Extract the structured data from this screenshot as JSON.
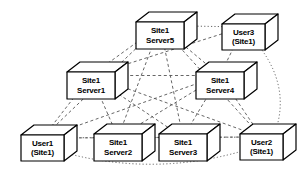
{
  "diagram": {
    "background_color": "#ffffff",
    "line_color": "#555555",
    "node_fill_color": "#ffffff",
    "node_stroke_color": "#000000",
    "node_shape": "3d-box",
    "nodes": [
      {
        "id": "server5",
        "kind": "server",
        "line1": "Site1",
        "line2": "Server5",
        "x": 136,
        "y": 12,
        "w": 48,
        "h": 27,
        "depth_x": 13,
        "depth_y": 10
      },
      {
        "id": "user3",
        "kind": "user",
        "line1": "User3",
        "line2": "(Site1)",
        "x": 222,
        "y": 14,
        "w": 43,
        "h": 26,
        "depth_x": 13,
        "depth_y": 10
      },
      {
        "id": "server1",
        "kind": "server",
        "line1": "Site1",
        "line2": "Server1",
        "x": 67,
        "y": 62,
        "w": 48,
        "h": 27,
        "depth_x": 13,
        "depth_y": 10
      },
      {
        "id": "server4",
        "kind": "server",
        "line1": "Site1",
        "line2": "Server4",
        "x": 196,
        "y": 62,
        "w": 48,
        "h": 27,
        "depth_x": 13,
        "depth_y": 10
      },
      {
        "id": "user1",
        "kind": "user",
        "line1": "User1",
        "line2": "(Site1)",
        "x": 21,
        "y": 125,
        "w": 43,
        "h": 26,
        "depth_x": 13,
        "depth_y": 10
      },
      {
        "id": "server2",
        "kind": "server",
        "line1": "Site1",
        "line2": "Server2",
        "x": 94,
        "y": 124,
        "w": 48,
        "h": 27,
        "depth_x": 13,
        "depth_y": 10
      },
      {
        "id": "server3",
        "kind": "server",
        "line1": "Site1",
        "line2": "Server3",
        "x": 159,
        "y": 124,
        "w": 48,
        "h": 27,
        "depth_x": 13,
        "depth_y": 10
      },
      {
        "id": "user2",
        "kind": "user",
        "line1": "User2",
        "line2": "(Site1)",
        "x": 240,
        "y": 124,
        "w": 43,
        "h": 26,
        "depth_x": 13,
        "depth_y": 10
      }
    ],
    "edges": [
      {
        "from": "server5",
        "to": "server1",
        "style": "dashed"
      },
      {
        "from": "server5",
        "to": "server4",
        "style": "dashed"
      },
      {
        "from": "server5",
        "to": "server2",
        "style": "dashed"
      },
      {
        "from": "server5",
        "to": "server3",
        "style": "dashed"
      },
      {
        "from": "server5",
        "to": "user1",
        "style": "dashed"
      },
      {
        "from": "server5",
        "to": "user2",
        "style": "dashed"
      },
      {
        "from": "server5",
        "to": "user3",
        "style": "dotted"
      },
      {
        "from": "server1",
        "to": "server4",
        "style": "dashed"
      },
      {
        "from": "server1",
        "to": "server2",
        "style": "dashed"
      },
      {
        "from": "server1",
        "to": "server3",
        "style": "dashed"
      },
      {
        "from": "server1",
        "to": "user1",
        "style": "dashed"
      },
      {
        "from": "server1",
        "to": "user2",
        "style": "dashed"
      },
      {
        "from": "server1",
        "to": "user3",
        "style": "dashed"
      },
      {
        "from": "server4",
        "to": "server2",
        "style": "dashed"
      },
      {
        "from": "server4",
        "to": "server3",
        "style": "dashed"
      },
      {
        "from": "server4",
        "to": "user1",
        "style": "dashed"
      },
      {
        "from": "server4",
        "to": "user2",
        "style": "dashed"
      },
      {
        "from": "server4",
        "to": "user3",
        "style": "dashed"
      },
      {
        "from": "server2",
        "to": "server3",
        "style": "dotted"
      },
      {
        "from": "server2",
        "to": "user1",
        "style": "dotted"
      },
      {
        "from": "server2",
        "to": "user2",
        "style": "dashed"
      },
      {
        "from": "server3",
        "to": "user1",
        "style": "dashed"
      },
      {
        "from": "server3",
        "to": "user2",
        "style": "dotted"
      },
      {
        "from": "user1",
        "to": "user2",
        "style": "dotted",
        "curve": "bottom"
      },
      {
        "from": "user3",
        "to": "user2",
        "style": "dotted",
        "curve": "right"
      }
    ]
  }
}
